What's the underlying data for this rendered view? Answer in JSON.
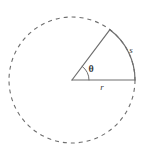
{
  "figure": {
    "type": "geometry-diagram",
    "background_color": "#ffffff",
    "stroke_color": "#6e6e6e",
    "label_color": "#3a3a3a",
    "circle": {
      "center_x": 72,
      "center_y": 80,
      "radius": 63,
      "style": "dashed",
      "dash_pattern": "4 4",
      "stroke_width": 1.1
    },
    "sector": {
      "vertex_x": 72,
      "vertex_y": 80,
      "radius": 63,
      "start_angle_deg": 0,
      "end_angle_deg": 53,
      "radius_line_horizontal_end_x": 135,
      "radius_line_horizontal_end_y": 80,
      "radius_line_upper_end_x": 110,
      "radius_line_upper_end_y": 30,
      "style": "solid",
      "stroke_width": 1.1
    },
    "angle_marker": {
      "radius": 17,
      "style": "solid",
      "stroke_width": 1.0
    },
    "labels": {
      "arc_label": "s",
      "arc_label_x": 131,
      "arc_label_y": 53,
      "radius_label": "r",
      "radius_label_x": 102,
      "radius_label_y": 90,
      "angle_label": "θ",
      "angle_label_x": 91,
      "angle_label_y": 72
    }
  }
}
